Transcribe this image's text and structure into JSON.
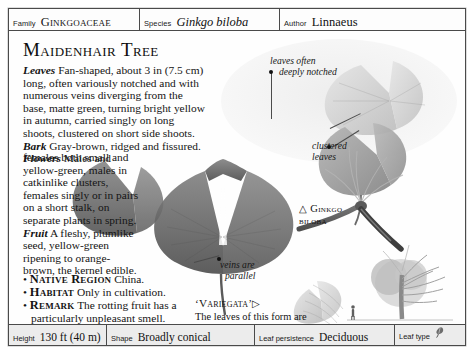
{
  "header": {
    "cells": [
      {
        "label": "Family",
        "value": "Ginkgoaceae"
      },
      {
        "label": "Species",
        "value": "Ginkgo biloba"
      },
      {
        "label": "Author",
        "value": "Linnaeus"
      }
    ]
  },
  "main": {
    "title": "Maidenhair Tree",
    "description_top": "Leaves Fan-shaped, about 3 in (7.5 cm) long, often variously notched and with numerous veins diverging from the base, matte green, turning bright yellow in autumn, carried singly on long shoots, clustered on short side shoots. Bark Gray-brown, ridged and fissured. Flowers Males and",
    "description_bottom": "females both small and yellow-green, males in catkinlike clusters, females singly or in pairs on a short stalk, on separate plants in spring. Fruit A fleshy, plumlike seed, yellow-green ripening to orange-brown, the kernel edible.",
    "bullets": [
      {
        "term": "Native Region",
        "text": "China."
      },
      {
        "term": "Habitat",
        "text": "Only in cultivation."
      },
      {
        "term": "Remark",
        "text": "The rotting fruit has a particularly unpleasant smell."
      }
    ]
  },
  "annotations": [
    {
      "name": "leaves-often-deeply-notched",
      "line1": "leaves often",
      "line2": "deeply notched"
    },
    {
      "name": "clustered-leaves",
      "line1": "clustered",
      "line2": "leaves"
    },
    {
      "name": "veins-are-parallel",
      "line1": "veins are",
      "line2": "parallel"
    }
  ],
  "specimen_caption": {
    "marker": "△",
    "line1": "Ginkgo",
    "line2": "biloba"
  },
  "variegata_caption": {
    "title": "‘Variegata’",
    "marker": "▷",
    "body": "The leaves of this form are banded with creamy yellow stripes."
  },
  "footer": {
    "cells": [
      {
        "label": "Height",
        "value": "130 ft (40 m)"
      },
      {
        "label": "Shape",
        "value": "Broadly conical"
      },
      {
        "label": "Leaf persistence",
        "value": "Deciduous"
      },
      {
        "label": "Leaf type",
        "value": ""
      }
    ],
    "leaf_type_icon": "fan-leaf-icon"
  },
  "colors": {
    "border": "#4a4a4a",
    "page": "#ffffff",
    "footer_band": "#ececec",
    "ink": "#141414",
    "illustration_dark": "#6e6e6e",
    "illustration_mid": "#9a9a9a",
    "illustration_light": "#c8c8c8"
  }
}
